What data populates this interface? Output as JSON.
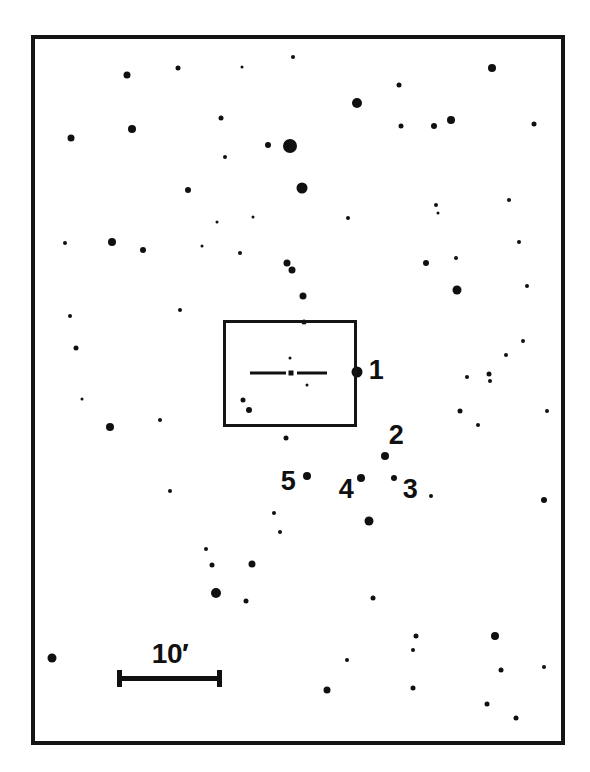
{
  "figure": {
    "kind": "astronomical-finder-chart",
    "width": 590,
    "height": 772,
    "background_color": "#ffffff",
    "ink_color": "#101010"
  },
  "frame": {
    "x": 31,
    "y": 35,
    "width": 534,
    "height": 710,
    "border_width": 4,
    "border_color": "#141414"
  },
  "detail_box": {
    "label": "",
    "x": 223,
    "y": 320,
    "width": 134,
    "height": 107,
    "border_width": 3,
    "border_color": "#141414"
  },
  "center_marker": {
    "type": "dash-dot-dash",
    "y": 373,
    "left_segment": {
      "x": 250,
      "width": 36,
      "height": 3
    },
    "right_segment": {
      "x": 297,
      "width": 30,
      "height": 3
    },
    "center_dot": {
      "cx": 291,
      "cy": 373,
      "size": 5
    },
    "offset_dot": {
      "cx": 307,
      "cy": 385,
      "size": 3
    }
  },
  "scale_bar": {
    "label": "10′",
    "value": 10,
    "unit": "arcmin",
    "unit_symbol": "′",
    "line": {
      "x": 117,
      "y": 676,
      "length": 105,
      "thickness": 5
    },
    "cap_height": 17,
    "cap_width": 5,
    "label_x": 170,
    "label_y": 640,
    "label_font_size": 28
  },
  "star_labels": [
    {
      "text": "1",
      "x": 376,
      "y": 370,
      "font_size": 27
    },
    {
      "text": "2",
      "x": 396,
      "y": 435,
      "font_size": 27
    },
    {
      "text": "3",
      "x": 410,
      "y": 489,
      "font_size": 27
    },
    {
      "text": "4",
      "x": 346,
      "y": 489,
      "font_size": 27
    },
    {
      "text": "5",
      "x": 288,
      "y": 481,
      "font_size": 27
    }
  ],
  "labeled_stars": [
    {
      "id": "1",
      "cx": 357,
      "cy": 372,
      "size": 11
    },
    {
      "id": "2",
      "cx": 385,
      "cy": 456,
      "size": 8
    },
    {
      "id": "3",
      "cx": 394,
      "cy": 478,
      "size": 6
    },
    {
      "id": "4",
      "cx": 361,
      "cy": 478,
      "size": 8
    },
    {
      "id": "5",
      "cx": 307,
      "cy": 476,
      "size": 8
    }
  ],
  "field_stars": [
    {
      "cx": 127,
      "cy": 75,
      "size": 7
    },
    {
      "cx": 178,
      "cy": 68,
      "size": 5
    },
    {
      "cx": 242,
      "cy": 67,
      "size": 3
    },
    {
      "cx": 293,
      "cy": 57,
      "size": 4
    },
    {
      "cx": 357,
      "cy": 103,
      "size": 10
    },
    {
      "cx": 399,
      "cy": 85,
      "size": 5
    },
    {
      "cx": 434,
      "cy": 126,
      "size": 6
    },
    {
      "cx": 492,
      "cy": 68,
      "size": 8
    },
    {
      "cx": 71,
      "cy": 138,
      "size": 7
    },
    {
      "cx": 132,
      "cy": 129,
      "size": 8
    },
    {
      "cx": 221,
      "cy": 118,
      "size": 5
    },
    {
      "cx": 225,
      "cy": 157,
      "size": 4
    },
    {
      "cx": 268,
      "cy": 145,
      "size": 6
    },
    {
      "cx": 290,
      "cy": 146,
      "size": 14
    },
    {
      "cx": 401,
      "cy": 126,
      "size": 5
    },
    {
      "cx": 451,
      "cy": 120,
      "size": 8
    },
    {
      "cx": 534,
      "cy": 124,
      "size": 5
    },
    {
      "cx": 188,
      "cy": 190,
      "size": 6
    },
    {
      "cx": 302,
      "cy": 188,
      "size": 11
    },
    {
      "cx": 436,
      "cy": 205,
      "size": 4
    },
    {
      "cx": 438,
      "cy": 213,
      "size": 3
    },
    {
      "cx": 217,
      "cy": 222,
      "size": 3
    },
    {
      "cx": 253,
      "cy": 217,
      "size": 3
    },
    {
      "cx": 348,
      "cy": 218,
      "size": 4
    },
    {
      "cx": 509,
      "cy": 200,
      "size": 4
    },
    {
      "cx": 65,
      "cy": 243,
      "size": 4
    },
    {
      "cx": 112,
      "cy": 242,
      "size": 8
    },
    {
      "cx": 143,
      "cy": 250,
      "size": 6
    },
    {
      "cx": 240,
      "cy": 253,
      "size": 4
    },
    {
      "cx": 287,
      "cy": 263,
      "size": 7
    },
    {
      "cx": 292,
      "cy": 270,
      "size": 7
    },
    {
      "cx": 426,
      "cy": 263,
      "size": 6
    },
    {
      "cx": 456,
      "cy": 258,
      "size": 4
    },
    {
      "cx": 457,
      "cy": 290,
      "size": 9
    },
    {
      "cx": 519,
      "cy": 242,
      "size": 4
    },
    {
      "cx": 527,
      "cy": 286,
      "size": 4
    },
    {
      "cx": 202,
      "cy": 246,
      "size": 3
    },
    {
      "cx": 303,
      "cy": 296,
      "size": 7
    },
    {
      "cx": 180,
      "cy": 310,
      "size": 4
    },
    {
      "cx": 70,
      "cy": 316,
      "size": 4
    },
    {
      "cx": 76,
      "cy": 348,
      "size": 5
    },
    {
      "cx": 304,
      "cy": 322,
      "size": 5
    },
    {
      "cx": 523,
      "cy": 341,
      "size": 4
    },
    {
      "cx": 506,
      "cy": 355,
      "size": 4
    },
    {
      "cx": 489,
      "cy": 374,
      "size": 5
    },
    {
      "cx": 249,
      "cy": 410,
      "size": 6
    },
    {
      "cx": 82,
      "cy": 399,
      "size": 3
    },
    {
      "cx": 110,
      "cy": 427,
      "size": 8
    },
    {
      "cx": 160,
      "cy": 420,
      "size": 4
    },
    {
      "cx": 286,
      "cy": 438,
      "size": 5
    },
    {
      "cx": 467,
      "cy": 377,
      "size": 4
    },
    {
      "cx": 490,
      "cy": 381,
      "size": 4
    },
    {
      "cx": 460,
      "cy": 411,
      "size": 5
    },
    {
      "cx": 478,
      "cy": 425,
      "size": 4
    },
    {
      "cx": 547,
      "cy": 411,
      "size": 4
    },
    {
      "cx": 170,
      "cy": 491,
      "size": 4
    },
    {
      "cx": 274,
      "cy": 513,
      "size": 4
    },
    {
      "cx": 280,
      "cy": 532,
      "size": 4
    },
    {
      "cx": 369,
      "cy": 521,
      "size": 9
    },
    {
      "cx": 431,
      "cy": 496,
      "size": 4
    },
    {
      "cx": 544,
      "cy": 500,
      "size": 6
    },
    {
      "cx": 206,
      "cy": 549,
      "size": 4
    },
    {
      "cx": 212,
      "cy": 565,
      "size": 5
    },
    {
      "cx": 252,
      "cy": 564,
      "size": 7
    },
    {
      "cx": 216,
      "cy": 593,
      "size": 10
    },
    {
      "cx": 246,
      "cy": 601,
      "size": 5
    },
    {
      "cx": 373,
      "cy": 598,
      "size": 5
    },
    {
      "cx": 416,
      "cy": 636,
      "size": 5
    },
    {
      "cx": 413,
      "cy": 650,
      "size": 4
    },
    {
      "cx": 347,
      "cy": 660,
      "size": 4
    },
    {
      "cx": 327,
      "cy": 690,
      "size": 7
    },
    {
      "cx": 413,
      "cy": 688,
      "size": 5
    },
    {
      "cx": 52,
      "cy": 658,
      "size": 9
    },
    {
      "cx": 495,
      "cy": 636,
      "size": 8
    },
    {
      "cx": 501,
      "cy": 670,
      "size": 5
    },
    {
      "cx": 544,
      "cy": 667,
      "size": 4
    },
    {
      "cx": 487,
      "cy": 704,
      "size": 5
    },
    {
      "cx": 516,
      "cy": 718,
      "size": 5
    },
    {
      "cx": 290,
      "cy": 358,
      "size": 3
    },
    {
      "cx": 243,
      "cy": 400,
      "size": 5
    }
  ]
}
